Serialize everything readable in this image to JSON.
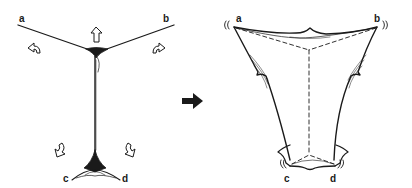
{
  "diagram": {
    "type": "before-after illustration",
    "colors": {
      "ink": "#1a1a1a",
      "background": "#ffffff"
    },
    "before": {
      "description": "Y-shaped folded membrane pulled at four corners",
      "labels": {
        "a": "a",
        "b": "b",
        "c": "c",
        "d": "d"
      },
      "arrows": [
        "curved-arrow-left",
        "up-arrow",
        "curved-arrow-right",
        "curved-arrow-bottom-left",
        "curved-arrow-bottom-right"
      ]
    },
    "transition": {
      "icon": "right-arrow"
    },
    "after": {
      "description": "Stretched tetrahedral membrane with dashed internal edges",
      "labels": {
        "a": "a",
        "b": "b",
        "c": "c",
        "d": "d"
      },
      "vibration_marks": [
        "(( a",
        "b ))",
        "(( c",
        "d ))"
      ]
    }
  }
}
